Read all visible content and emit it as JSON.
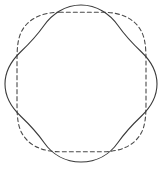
{
  "figure": {
    "background_color": "#ffffff",
    "width": 164,
    "height": 173,
    "shapes": [
      {
        "id": "wavy-quadrilobe",
        "name": "Four-lobed wavy closed curve",
        "style": "solid",
        "stroke_color": "#3a3a3a",
        "stroke_width": 1.1,
        "dash_pattern": "none",
        "center": [
          81,
          84
        ],
        "mean_radius": 67,
        "lobe_amplitude": 9,
        "lobe_count": 4,
        "lobe_phase_deg": 0,
        "bounds": {
          "x_min": 5,
          "x_max": 157,
          "y_min": 5,
          "y_max": 162
        },
        "path": "M 157.0 84.0 C 157.0 97.0 150.5 107.5 141.0 116.5 C 131.0 126.0 124.0 134.0 118.0 142.5 C 110.0 154.0 97.0 162.0 81.0 162.0 C 65.0 162.0 52.0 154.0 44.0 142.5 C 38.0 134.0 31.0 126.0 21.0 116.5 C 11.5 107.5 5.0 97.0 5.0 84.0 C 5.0 71.0 11.5 60.5 21.0 51.5 C 31.0 42.0 38.0 34.0 44.0 25.5 C 52.0 14.0 65.0 5.0 81.0 5.0 C 97.0 5.0 110.0 14.0 118.0 25.5 C 124.0 34.0 131.0 42.0 141.0 51.5 C 150.5 60.5 157.0 71.0 157.0 84.0 Z"
      },
      {
        "id": "rounded-square",
        "name": "Rounded square (squircle)",
        "style": "dashed",
        "stroke_color": "#4a4a4a",
        "stroke_width": 1.1,
        "dash_pattern": "4 3",
        "center": [
          81.5,
          82
        ],
        "corner_radius": 44,
        "side_length": 129,
        "bounds": {
          "x_min": 17,
          "x_max": 146,
          "y_min": 12,
          "y_max": 152
        },
        "path": "M 61.0 12.2 C 40.0 12.2 27.5 20.0 21.5 31.5 C 17.5 39.5 17.0 49.0 17.0 62.0 L 17.0 102.0 C 17.0 115.0 17.5 124.5 21.5 132.5 C 27.5 144.0 40.0 151.8 61.0 151.8 L 102.0 151.8 C 123.0 151.8 135.5 144.0 141.5 132.5 C 145.5 124.5 146.0 115.0 146.0 102.0 L 146.0 62.0 C 146.0 49.0 145.5 39.5 141.5 31.5 C 135.5 20.0 123.0 12.2 102.0 12.2 Z"
      }
    ]
  }
}
